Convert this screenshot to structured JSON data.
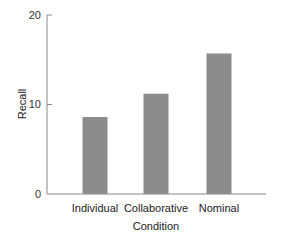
{
  "chart_data": {
    "type": "bar",
    "title": "",
    "xlabel": "Condition",
    "ylabel": "Recall",
    "categories": [
      "Individual",
      "Collaborative",
      "Nominal"
    ],
    "values": [
      8.6,
      11.2,
      15.7
    ],
    "ylim": [
      0,
      20
    ],
    "yticks": [
      0,
      10,
      20
    ],
    "grid": false,
    "legend": null,
    "bar_color": "#8c8c8c"
  }
}
